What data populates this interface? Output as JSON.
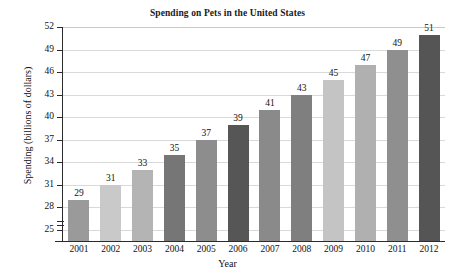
{
  "chart_data": {
    "type": "bar",
    "title": "Spending on Pets in the United States",
    "xlabel": "Year",
    "ylabel": "Spending (billions of dollars)",
    "categories": [
      "2001",
      "2002",
      "2003",
      "2004",
      "2005",
      "2006",
      "2007",
      "2008",
      "2009",
      "2010",
      "2011",
      "2012"
    ],
    "values": [
      29,
      31,
      33,
      35,
      37,
      39,
      41,
      43,
      45,
      47,
      49,
      51
    ],
    "ylim": [
      23.5,
      52
    ],
    "yticks": [
      25,
      28,
      31,
      34,
      37,
      40,
      43,
      46,
      49,
      52
    ],
    "ytick_labels": [
      "25",
      "28",
      "31",
      "34",
      "37",
      "40",
      "43",
      "46",
      "49",
      "52"
    ],
    "grid": "horizontal",
    "legend": "none",
    "axis_break": true,
    "bar_colors": [
      "#9a9a9a",
      "#c9c9c9",
      "#b4b4b4",
      "#767676",
      "#8d8d8d",
      "#565656",
      "#8a8a8a",
      "#7f7f7f",
      "#c4c4c4",
      "#b0b0b0",
      "#8f8f8f",
      "#555555"
    ],
    "data_labels": [
      "29",
      "31",
      "33",
      "35",
      "37",
      "39",
      "41",
      "43",
      "45",
      "47",
      "49",
      "51"
    ]
  }
}
